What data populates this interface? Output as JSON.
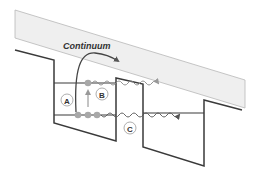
{
  "diagram": {
    "continuum_label": "Continuum",
    "labels": {
      "a": "A",
      "b": "B",
      "c": "C"
    },
    "colors": {
      "band_fill": "#efefef",
      "band_stroke": "#b8b8b8",
      "line": "#3a3a3a",
      "electron": "#a8a8a8",
      "arrow": "#555555",
      "circle_stroke": "#999999"
    }
  }
}
